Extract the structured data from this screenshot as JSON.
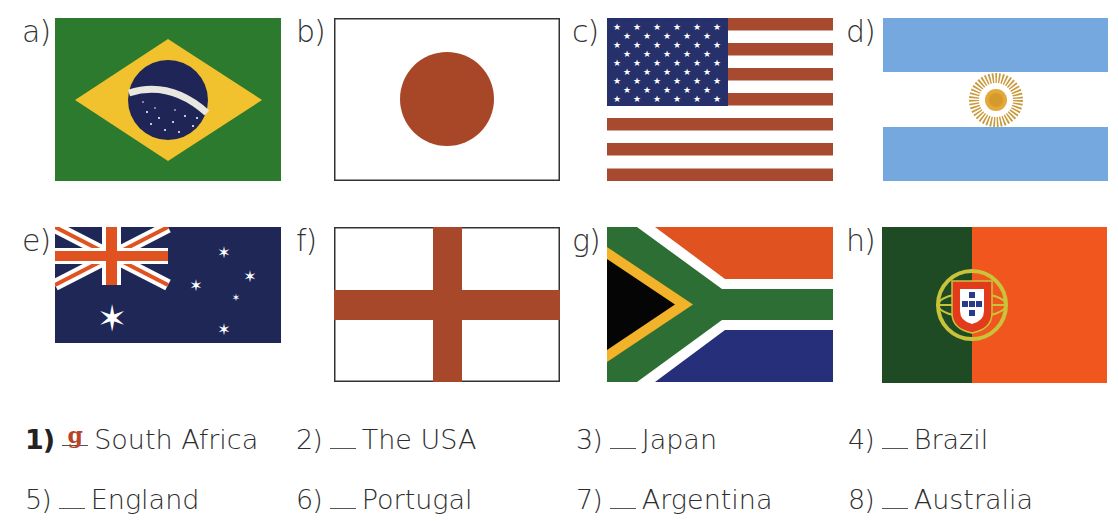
{
  "exercise": {
    "flags": [
      {
        "letter": "a)",
        "country_depicted": "Brazil",
        "motto_band": "ORDEM E PROGRESSO"
      },
      {
        "letter": "b)",
        "country_depicted": "Japan"
      },
      {
        "letter": "c)",
        "country_depicted": "The USA"
      },
      {
        "letter": "d)",
        "country_depicted": "Argentina"
      },
      {
        "letter": "e)",
        "country_depicted": "Australia"
      },
      {
        "letter": "f)",
        "country_depicted": "England"
      },
      {
        "letter": "g)",
        "country_depicted": "South Africa"
      },
      {
        "letter": "h)",
        "country_depicted": "Portugal"
      }
    ],
    "items": [
      {
        "number": "1)",
        "answer": "g",
        "country": "South Africa"
      },
      {
        "number": "2)",
        "answer": "",
        "country": "The USA"
      },
      {
        "number": "3)",
        "answer": "",
        "country": "Japan"
      },
      {
        "number": "4)",
        "answer": "",
        "country": "Brazil"
      },
      {
        "number": "5)",
        "answer": "",
        "country": "England"
      },
      {
        "number": "6)",
        "answer": "",
        "country": "Portugal"
      },
      {
        "number": "7)",
        "answer": "",
        "country": "Argentina"
      },
      {
        "number": "8)",
        "answer": "",
        "country": "Australia"
      }
    ]
  },
  "colors": {
    "answer_text": "#b5452a",
    "brazil_green": "#2b7a2e",
    "brazil_yellow": "#f2c12e",
    "navy": "#1f2a5c",
    "red_brown": "#a84a30",
    "argentina_blue": "#74a8de",
    "sun_gold": "#d6a43a",
    "orange_red": "#e0521f",
    "sa_green": "#2d6e35",
    "portugal_green": "#1e4a24",
    "portugal_red": "#f0561e"
  }
}
